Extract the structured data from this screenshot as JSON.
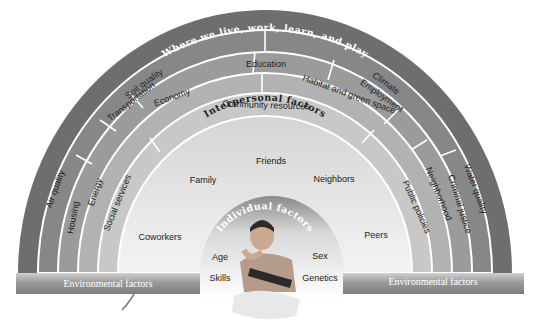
{
  "diagram": {
    "title_outer": "Where we live, work, learn, and play",
    "rings": [
      {
        "level": 1,
        "labels": [
          "Air quality",
          "Soil quality",
          "Climate",
          "Water quality"
        ]
      },
      {
        "level": 2,
        "labels": [
          "Housing",
          "Transportation",
          "Education",
          "Employment",
          "Criminal justice"
        ]
      },
      {
        "level": 3,
        "labels": [
          "Energy",
          "Economy",
          "Habitat and green space",
          "Neighborhood"
        ]
      },
      {
        "level": 4,
        "labels": [
          "Social services",
          "Community resources",
          "Public policies"
        ]
      }
    ],
    "interpersonal": {
      "title": "Interpersonal factors",
      "items": [
        "Friends",
        "Family",
        "Neighbors",
        "Coworkers",
        "Peers"
      ]
    },
    "individual": {
      "title": "Individual factors",
      "items": [
        "Age",
        "Sex",
        "Skills",
        "Genetics"
      ]
    },
    "banner": {
      "left": "Environmental factors",
      "right": "Environmental factors"
    },
    "colors": {
      "ring1": "#6e6e6e",
      "ring2": "#878787",
      "ring3": "#9b9b9b",
      "ring4": "#b2b2b2",
      "ring5": "#c8c8c8",
      "interpersonal": "#e2e2e2",
      "divider": "#ffffff"
    }
  }
}
